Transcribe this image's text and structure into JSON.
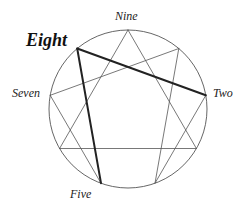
{
  "diagram": {
    "type": "enneagram",
    "circle": {
      "cx": 128,
      "cy": 109,
      "r": 79,
      "stroke": "#555555"
    },
    "points": {
      "9": [
        128,
        30
      ],
      "1": [
        178.8,
        48.5
      ],
      "2": [
        205.8,
        95.3
      ],
      "3": [
        196.4,
        148.5
      ],
      "4": [
        155.0,
        183.2
      ],
      "5": [
        101.0,
        183.2
      ],
      "6": [
        59.6,
        148.5
      ],
      "7": [
        50.2,
        95.3
      ],
      "8": [
        77.2,
        48.5
      ]
    },
    "thin_lines": [
      [
        "9",
        "3"
      ],
      [
        "3",
        "6"
      ],
      [
        "6",
        "9"
      ],
      [
        "1",
        "4"
      ],
      [
        "4",
        "2"
      ],
      [
        "5",
        "7"
      ],
      [
        "7",
        "1"
      ]
    ],
    "thick_lines": [
      [
        "2",
        "8"
      ],
      [
        "8",
        "5"
      ]
    ],
    "thin_color": "#555555",
    "thick_color": "#222222"
  },
  "labels": {
    "nine": "Nine",
    "eight": "Eight",
    "seven": "Seven",
    "two": "Two",
    "five": "Five"
  }
}
